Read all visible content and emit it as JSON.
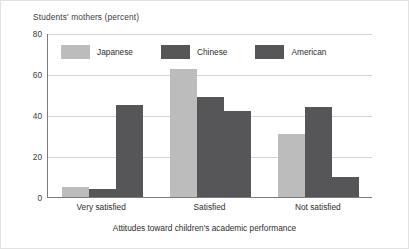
{
  "chart_data": {
    "type": "bar",
    "title": "",
    "ylabel": "Students' mothers (percent)",
    "xlabel": "Attitudes toward children's academic performance",
    "categories": [
      "Very satisfied",
      "Satisfied",
      "Not satisfied"
    ],
    "series": [
      {
        "name": "Japanese",
        "color": "#bcbcbc",
        "values": [
          5,
          63,
          31
        ]
      },
      {
        "name": "Chinese",
        "color": "#565658",
        "values": [
          4,
          49,
          44
        ]
      },
      {
        "name": "American",
        "color": "#565658",
        "values": [
          45,
          42,
          10
        ]
      }
    ],
    "ylim": [
      0,
      80
    ],
    "yticks": [
      0,
      20,
      40,
      60,
      80
    ],
    "ytick_labels": [
      "0",
      "20",
      "40",
      "60",
      "80"
    ],
    "grid": true,
    "legend_position": "top-inside"
  },
  "legend": {
    "items": [
      {
        "label": "Japanese"
      },
      {
        "label": "Chinese"
      },
      {
        "label": "American"
      }
    ]
  }
}
